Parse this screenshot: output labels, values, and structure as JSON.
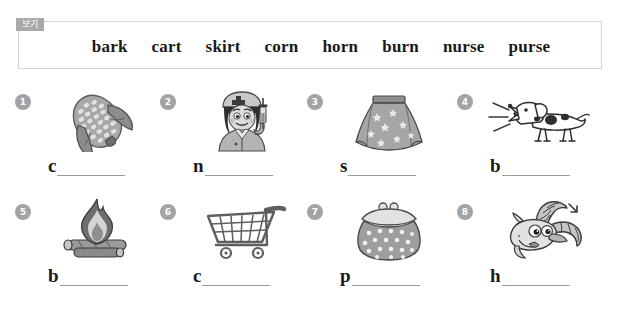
{
  "worksheet": {
    "word_bank": {
      "tag_label": "보기",
      "words": [
        "bark",
        "cart",
        "skirt",
        "corn",
        "horn",
        "burn",
        "nurse",
        "purse"
      ],
      "border_color": "#d6d6d8",
      "tag_color": "#a9a9ab"
    },
    "badge_color": "#a3a3a5",
    "items": [
      {
        "number": "1",
        "icon": "corn-cob-icon",
        "answer_initial": "c",
        "blank_label": ""
      },
      {
        "number": "2",
        "icon": "nurse-icon",
        "answer_initial": "n",
        "blank_label": ""
      },
      {
        "number": "3",
        "icon": "skirt-icon",
        "answer_initial": "s",
        "blank_label": ""
      },
      {
        "number": "4",
        "icon": "barking-dog-icon",
        "answer_initial": "b",
        "blank_label": ""
      },
      {
        "number": "5",
        "icon": "campfire-icon",
        "answer_initial": "b",
        "blank_label": ""
      },
      {
        "number": "6",
        "icon": "shopping-cart-icon",
        "answer_initial": "c",
        "blank_label": ""
      },
      {
        "number": "7",
        "icon": "coin-purse-icon",
        "answer_initial": "p",
        "blank_label": ""
      },
      {
        "number": "8",
        "icon": "goat-horns-icon",
        "answer_initial": "h",
        "blank_label": ""
      }
    ]
  }
}
